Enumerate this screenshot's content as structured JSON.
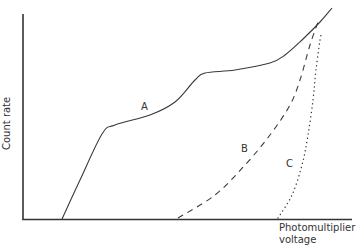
{
  "chart_data": {
    "type": "line",
    "title": "",
    "xlabel": "Photomultiplier voltage",
    "ylabel": "Count rate",
    "grid": false,
    "legend": "none (curves labeled inline)",
    "ticks": "none",
    "series": [
      {
        "name": "A",
        "style": "solid",
        "points": [
          [
            62,
            219
          ],
          [
            80,
            180
          ],
          [
            102,
            134
          ],
          [
            115,
            125
          ],
          [
            150,
            115
          ],
          [
            175,
            102
          ],
          [
            195,
            80
          ],
          [
            205,
            73
          ],
          [
            235,
            70
          ],
          [
            270,
            63
          ],
          [
            285,
            55
          ],
          [
            302,
            40
          ],
          [
            320,
            22
          ],
          [
            332,
            8
          ]
        ]
      },
      {
        "name": "B",
        "style": "dashed",
        "points": [
          [
            178,
            218
          ],
          [
            215,
            195
          ],
          [
            245,
            165
          ],
          [
            270,
            135
          ],
          [
            290,
            105
          ],
          [
            300,
            80
          ],
          [
            310,
            45
          ],
          [
            318,
            22
          ]
        ]
      },
      {
        "name": "C",
        "style": "dotted",
        "points": [
          [
            278,
            218
          ],
          [
            292,
            195
          ],
          [
            302,
            165
          ],
          [
            308,
            135
          ],
          [
            313,
            100
          ],
          [
            316,
            70
          ],
          [
            320,
            40
          ],
          [
            322,
            32
          ]
        ]
      }
    ]
  },
  "labels": {
    "ylabel": "Count rate",
    "xlabel_line1": "Photomultiplier",
    "xlabel_line2": "voltage",
    "curve_a": "A",
    "curve_b": "B",
    "curve_c": "C"
  },
  "colors": {
    "line": "#3a3a3a",
    "axis": "#333333",
    "background": "#ffffff"
  }
}
